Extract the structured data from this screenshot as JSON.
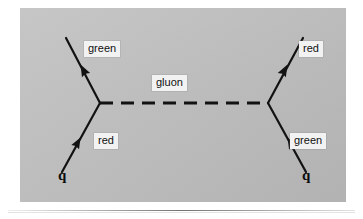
{
  "figure": {
    "type": "feynman-diagram",
    "background_color": "#bebebe",
    "line_color": "#121212",
    "label_box_color": "#f2f2f2"
  },
  "labels": {
    "upper_left": "green",
    "lower_left": "red",
    "center": "gluon",
    "upper_right": "red",
    "lower_right": "green",
    "quark_left": "q",
    "quark_right": "q"
  },
  "vertices": {
    "left": {
      "x": 100,
      "y": 103
    },
    "right": {
      "x": 268,
      "y": 103
    }
  },
  "lines": [
    {
      "name": "incoming-quark-left",
      "from": {
        "x": 62,
        "y": 172
      },
      "to": {
        "x": 100,
        "y": 103
      },
      "style": "solid",
      "arrow": "mid-forward"
    },
    {
      "name": "outgoing-quark-left",
      "from": {
        "x": 100,
        "y": 103
      },
      "to": {
        "x": 66,
        "y": 38
      },
      "style": "solid",
      "arrow": "mid-forward"
    },
    {
      "name": "gluon-propagator",
      "from": {
        "x": 100,
        "y": 103
      },
      "to": {
        "x": 268,
        "y": 103
      },
      "style": "dashed",
      "arrow": "none"
    },
    {
      "name": "incoming-quark-right",
      "from": {
        "x": 306,
        "y": 172
      },
      "to": {
        "x": 268,
        "y": 103
      },
      "style": "solid",
      "arrow": "mid-forward"
    },
    {
      "name": "outgoing-quark-right",
      "from": {
        "x": 268,
        "y": 103
      },
      "to": {
        "x": 303,
        "y": 38
      },
      "style": "solid",
      "arrow": "mid-forward"
    }
  ],
  "colour_flow": {
    "incoming_left": "red",
    "outgoing_left": "green",
    "incoming_right": "green",
    "outgoing_right": "red",
    "exchanged": "gluon"
  }
}
